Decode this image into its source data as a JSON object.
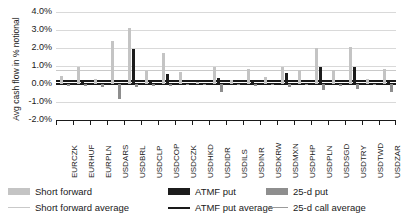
{
  "chart_data": {
    "type": "bar",
    "title": "",
    "xlabel": "",
    "ylabel": "Avg cash flow in % notional",
    "ylim": [
      -2.0,
      4.0
    ],
    "ytick_labels": [
      "4.0%",
      "3.0%",
      "2.0%",
      "1.0%",
      "0.0%",
      "-1.0%",
      "-2.0%"
    ],
    "ytick_values": [
      4.0,
      3.0,
      2.0,
      1.0,
      0.0,
      -1.0,
      -2.0
    ],
    "grid": true,
    "legend_position": "bottom",
    "categories": [
      "EURCZK",
      "EURHUF",
      "EURPLN",
      "USDARS",
      "USDBRL",
      "USDCLP",
      "USDCOP",
      "USDCZK",
      "USDHKD",
      "USDIDR",
      "USDILS",
      "USDINR",
      "USDKRW",
      "USDMXN",
      "USDPHP",
      "USDPLN",
      "USDSGD",
      "USDTRY",
      "USDTWD",
      "USDZAR"
    ],
    "series": [
      {
        "name": "Short forward",
        "color": "#c4c4c4",
        "values": [
          0.45,
          0.95,
          0.3,
          2.4,
          3.1,
          0.75,
          1.75,
          0.65,
          0.1,
          0.95,
          0.22,
          0.85,
          0.4,
          0.95,
          0.78,
          2.0,
          0.8,
          2.05,
          0.3,
          0.85
        ]
      },
      {
        "name": "ATMF put",
        "color": "#1c1c1c",
        "values": [
          0.05,
          0.12,
          0.06,
          0.07,
          1.92,
          0.1,
          0.58,
          0.08,
          0.02,
          0.33,
          0.04,
          0.17,
          0.05,
          0.6,
          0.06,
          0.95,
          0.08,
          0.92,
          0.05,
          0.22
        ]
      },
      {
        "name": "25-d put",
        "color": "#8e8e8e",
        "values": [
          -0.1,
          -0.12,
          -0.15,
          -0.85,
          -0.18,
          -0.12,
          -0.1,
          -0.08,
          -0.05,
          -0.42,
          -0.06,
          -0.1,
          -0.08,
          -0.16,
          -0.08,
          -0.35,
          -0.09,
          -0.3,
          -0.06,
          -0.45
        ]
      }
    ],
    "reference_lines": [
      {
        "name": "Short forward average",
        "value": 0.8,
        "color": "#c9c9c9"
      },
      {
        "name": "ATMF put average",
        "value": 0.25,
        "color": "#1a1a1a"
      },
      {
        "name": "25-d call average",
        "value": 0.08,
        "color": "#9a9a9a"
      }
    ]
  },
  "legend": {
    "entries": [
      {
        "label": "Short forward",
        "kind": "bar",
        "color": "#c4c4c4"
      },
      {
        "label": "ATMF put",
        "kind": "bar",
        "color": "#1c1c1c"
      },
      {
        "label": "25-d put",
        "kind": "bar",
        "color": "#8e8e8e"
      },
      {
        "label": "Short forward average",
        "kind": "line",
        "color": "#c9c9c9"
      },
      {
        "label": "ATMF put average",
        "kind": "line",
        "color": "#1a1a1a"
      },
      {
        "label": "25-d call average",
        "kind": "line",
        "color": "#9a9a9a"
      }
    ]
  }
}
